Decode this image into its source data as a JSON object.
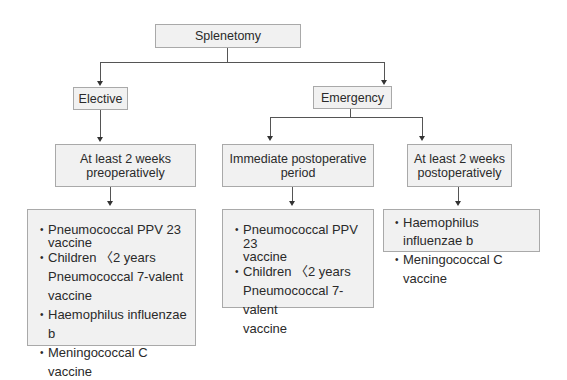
{
  "root": {
    "label": "Splenetomy"
  },
  "branches": [
    {
      "label": "Elective",
      "timings": [
        {
          "label": "At least 2 weeks preoperatively",
          "lines": [
            "At least 2 weeks",
            "preoperatively"
          ],
          "vaccines": [
            {
              "text": "Pneumococcal PPV 23",
              "bullet": true
            },
            {
              "text": "vaccine",
              "bullet": false
            },
            {
              "text": "Children 〈2 years",
              "bullet": true
            },
            {
              "text": "Pneumococcal 7-valent",
              "bullet": false
            },
            {
              "text": "vaccine",
              "bullet": false
            },
            {
              "text": "Haemophilus influenzae b",
              "bullet": true
            },
            {
              "text": "Meningococcal C vaccine",
              "bullet": true
            }
          ]
        }
      ]
    },
    {
      "label": "Emergency",
      "timings": [
        {
          "label": "Immediate postoperative period",
          "lines": [
            "Immediate postoperative",
            "period"
          ],
          "vaccines": [
            {
              "text": "Pneumococcal PPV 23",
              "bullet": true
            },
            {
              "text": "vaccine",
              "bullet": false
            },
            {
              "text": "Children 〈2 years",
              "bullet": true
            },
            {
              "text": "Pneumococcal 7-valent",
              "bullet": false
            },
            {
              "text": "vaccine",
              "bullet": false
            }
          ]
        },
        {
          "label": "At least 2 weeks postoperatively",
          "lines": [
            "At least 2 weeks",
            "postoperatively"
          ],
          "vaccines": [
            {
              "text": "Haemophilus influenzae b",
              "bullet": true
            },
            {
              "text": "Meningococcal C vaccine",
              "bullet": true
            }
          ]
        }
      ]
    }
  ],
  "colors": {
    "box_fill": "#f1f1f1",
    "box_border": "#a9a9a9",
    "connector": "#555555",
    "text": "#2a2a2a"
  }
}
